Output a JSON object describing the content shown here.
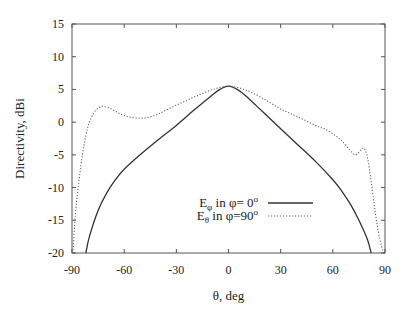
{
  "chart_data": {
    "type": "line",
    "title": "",
    "xlabel": "θ, deg",
    "ylabel": "Directivity, dBi",
    "xlim": [
      -90,
      90
    ],
    "ylim": [
      -20,
      15
    ],
    "xticks": [
      -90,
      -60,
      -30,
      0,
      30,
      60,
      90
    ],
    "yticks": [
      15,
      10,
      5,
      0,
      -5,
      -10,
      -15,
      -20
    ],
    "grid": false,
    "legend_position": "bottom-center",
    "series": [
      {
        "name": "E_phi in phi= 0°",
        "legend": {
          "main": "E",
          "sub": "φ",
          "rest": " in φ=  0",
          "sup": "o"
        },
        "style": "solid",
        "x": [
          -82,
          -80,
          -75,
          -70,
          -65,
          -60,
          -50,
          -40,
          -30,
          -20,
          -10,
          -5,
          0,
          5,
          10,
          20,
          30,
          40,
          50,
          60,
          65,
          70,
          75,
          80,
          82
        ],
        "y": [
          -20,
          -17.5,
          -13.5,
          -10.8,
          -8.8,
          -7.2,
          -4.8,
          -2.6,
          -0.5,
          1.8,
          4.0,
          5.0,
          5.5,
          5.0,
          4.0,
          1.5,
          -1.0,
          -3.5,
          -6.0,
          -8.8,
          -10.5,
          -12.5,
          -15.0,
          -18.0,
          -20
        ]
      },
      {
        "name": "E_theta in phi=90°",
        "legend": {
          "main": "E",
          "sub": "θ",
          "rest": " in φ=90",
          "sup": "o"
        },
        "style": "dotted",
        "x": [
          -89.5,
          -88,
          -86,
          -84,
          -82,
          -80,
          -77,
          -74,
          -72,
          -68,
          -64,
          -60,
          -55,
          -50,
          -45,
          -40,
          -30,
          -20,
          -10,
          0,
          10,
          20,
          30,
          40,
          50,
          55,
          60,
          65,
          70,
          73,
          76,
          78,
          80,
          82,
          84,
          86,
          88,
          89.5
        ],
        "y": [
          -20,
          -14,
          -9,
          -5,
          -2,
          0,
          1.6,
          2.3,
          2.4,
          2.1,
          1.5,
          1.0,
          0.7,
          0.6,
          0.8,
          1.3,
          2.6,
          3.8,
          4.9,
          5.5,
          4.9,
          3.6,
          2.0,
          0.8,
          -0.5,
          -1.0,
          -1.8,
          -2.8,
          -4.3,
          -5.0,
          -4.3,
          -4.0,
          -5.5,
          -9.0,
          -13.0,
          -16.5,
          -19.0,
          -20
        ]
      }
    ]
  }
}
